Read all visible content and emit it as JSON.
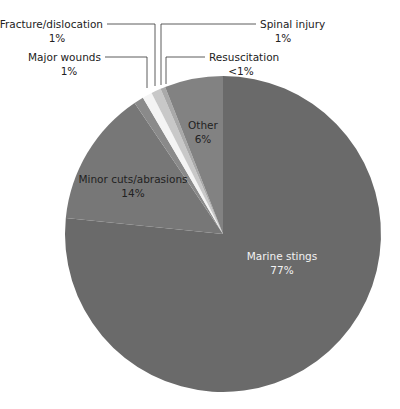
{
  "chart_data": {
    "type": "pie",
    "title": "",
    "start_angle_deg": 0,
    "direction": "clockwise",
    "slices": [
      {
        "label": "Marine stings",
        "value": 77,
        "display": "77%",
        "color": "#6a6a6a"
      },
      {
        "label": "Minor cuts/abrasions",
        "value": 14,
        "display": "14%",
        "color": "#777777"
      },
      {
        "label": "Major wounds",
        "value": 1,
        "display": "1%",
        "color": "#8a8a8a"
      },
      {
        "label": "Fracture/dislocation",
        "value": 1,
        "display": "1%",
        "color": "#f4f4f4"
      },
      {
        "label": "Spinal injury",
        "value": 1,
        "display": "1%",
        "color": "#c8c8c8"
      },
      {
        "label": "Resuscitation",
        "value": 0.5,
        "display": "<1%",
        "color": "#a9a9a9"
      },
      {
        "label": "Other",
        "value": 6,
        "display": "6%",
        "color": "#828282"
      }
    ]
  },
  "labels": {
    "marine": {
      "name": "Marine stings",
      "pct": "77%"
    },
    "minor": {
      "name": "Minor cuts/abrasions",
      "pct": "14%"
    },
    "other": {
      "name": "Other",
      "pct": "6%"
    },
    "fracture": {
      "name": "Fracture/dislocation",
      "pct": "1%"
    },
    "major": {
      "name": "Major wounds",
      "pct": "1%"
    },
    "spinal": {
      "name": "Spinal injury",
      "pct": "1%"
    },
    "resus": {
      "name": "Resuscitation",
      "pct": "<1%"
    }
  }
}
